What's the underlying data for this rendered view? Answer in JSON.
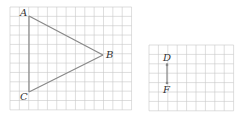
{
  "figure": {
    "grids": [
      {
        "id": "grid-left",
        "x": 10,
        "y": 7,
        "cols": 13,
        "rows": 11,
        "cell": 9.35
      },
      {
        "id": "grid-right",
        "x": 149,
        "y": 45,
        "cols": 9,
        "rows": 7,
        "cell": 9.4
      }
    ],
    "triangle": {
      "points": {
        "A": {
          "label": "A",
          "x": 29,
          "y": 16
        },
        "B": {
          "label": "B",
          "x": 103,
          "y": 55
        },
        "C": {
          "label": "C",
          "x": 29,
          "y": 92
        }
      }
    },
    "segment": {
      "points": {
        "D": {
          "label": "D",
          "x": 167,
          "y": 63
        },
        "F": {
          "label": "F",
          "x": 167,
          "y": 83
        }
      }
    },
    "colors": {
      "grid": "#c8c8c8",
      "line": "#888888",
      "text": "#333333"
    }
  }
}
